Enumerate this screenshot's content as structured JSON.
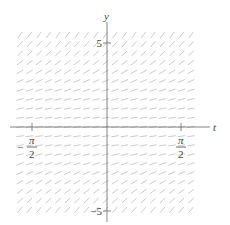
{
  "diagram": {
    "type": "slope_field",
    "equation_hint": "dy/dt ≈ 0.35 + 0.12 y^2",
    "axes": {
      "x_label": "t",
      "y_label": "y",
      "origin_px": [
        107,
        127
      ],
      "x_ticks": [
        {
          "value": -1.5708,
          "px": 32,
          "num": "π",
          "den": "2",
          "sign": "−"
        },
        {
          "value": 1.5708,
          "px": 181,
          "num": "π",
          "den": "2",
          "sign": ""
        }
      ],
      "y_ticks": [
        {
          "value": 5,
          "px": 43,
          "label": "5"
        },
        {
          "value": -5,
          "px": 211,
          "label": "−5"
        }
      ]
    },
    "grid": {
      "x_start": 20,
      "x_end": 200,
      "x_step": 9.5,
      "y_start": 35,
      "y_end": 218,
      "y_step": 9.2,
      "segment_length": 7.5
    },
    "colors": {
      "axis": "#777777",
      "segment": "#c4c4c4",
      "text": "#444444"
    }
  }
}
